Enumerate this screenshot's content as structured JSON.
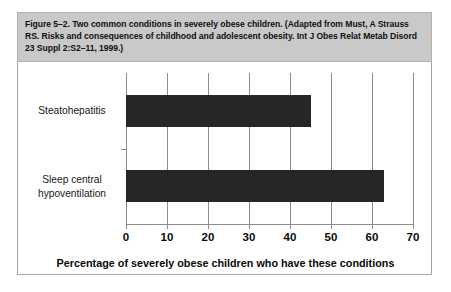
{
  "figure": {
    "caption": "Figure 5–2. Two common conditions in severely obese children. (Adapted from Must, A Strauss RS. Risks and consequences of childhood and adolescent obesity. Int J Obes Relat Metab Disord 23 Suppl 2:S2–11, 1999.)"
  },
  "chart_data": {
    "type": "bar",
    "orientation": "horizontal",
    "title": "",
    "categories": [
      "Steatohepatitis",
      "Sleep central\nhypoventilation"
    ],
    "values": [
      45,
      63
    ],
    "xlabel": "Percentage of severely obese children who have these conditions",
    "ylabel": "",
    "xlim": [
      0,
      70
    ],
    "xticks": [
      0,
      10,
      20,
      30,
      40,
      50,
      60,
      70
    ],
    "xtick_labels": [
      "0",
      "10",
      "20",
      "30",
      "40",
      "50",
      "60",
      "70"
    ],
    "grid": "vertical",
    "legend": "none",
    "bar_color": "#262626",
    "grid_color": "#8d8d8d"
  },
  "colors": {
    "caption_background": "#c9c9c9",
    "caption_border": "#b2b2b2",
    "plot_background": "#ffffff",
    "plot_border": "#a6a6a6",
    "bar": "#262626",
    "text": "#101010"
  }
}
